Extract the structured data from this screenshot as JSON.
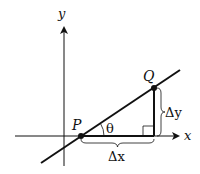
{
  "diagram": {
    "axes": {
      "x_label": "x",
      "y_label": "y"
    },
    "points": {
      "P": "P",
      "Q": "Q"
    },
    "angle_label": "θ",
    "delta_x_label": "Δx",
    "delta_y_label": "Δy",
    "colors": {
      "stroke": "#111111",
      "background": "#ffffff"
    }
  }
}
